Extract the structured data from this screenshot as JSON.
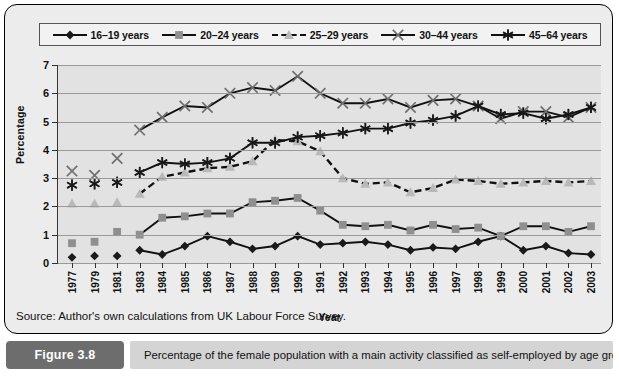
{
  "figure": {
    "badge": "Figure 3.8",
    "caption": "Percentage of the female population with a main activity classified as self-employed by age group",
    "source": "Source: Author's own calculations from UK Labour Force Survey."
  },
  "chart_data": {
    "type": "line",
    "title": "",
    "xlabel": "Year",
    "ylabel": "Percentage",
    "ylim": [
      0,
      7
    ],
    "yticks": [
      0,
      1,
      2,
      3,
      4,
      5,
      6,
      7
    ],
    "grid": true,
    "legend_position": "top",
    "categories": [
      "1977",
      "1979",
      "1981",
      "1983",
      "1984",
      "1985",
      "1986",
      "1987",
      "1988",
      "1989",
      "1990",
      "1991",
      "1992",
      "1993",
      "1994",
      "1995",
      "1996",
      "1997",
      "1998",
      "1999",
      "2000",
      "2001",
      "2002",
      "2003"
    ],
    "series": [
      {
        "name": "16–19 years",
        "marker": "diamond",
        "color": "#1a1a1a",
        "line": "solid",
        "values": [
          0.2,
          0.25,
          0.25,
          0.45,
          0.3,
          0.6,
          0.95,
          0.75,
          0.5,
          0.6,
          0.95,
          0.65,
          0.7,
          0.75,
          0.65,
          0.45,
          0.55,
          0.5,
          0.75,
          0.95,
          0.45,
          0.6,
          0.35,
          0.3
        ]
      },
      {
        "name": "20–24 years",
        "marker": "square",
        "color": "#8f8f8f",
        "line": "solid",
        "values": [
          0.7,
          0.75,
          1.1,
          1.0,
          1.6,
          1.65,
          1.75,
          1.75,
          2.15,
          2.2,
          2.3,
          1.85,
          1.35,
          1.3,
          1.35,
          1.15,
          1.35,
          1.2,
          1.25,
          0.95,
          1.3,
          1.3,
          1.1,
          1.3
        ]
      },
      {
        "name": "25–29 years",
        "marker": "triangle",
        "color": "#b9b9b9",
        "line": "dashed",
        "values": [
          2.1,
          2.1,
          2.15,
          2.45,
          3.05,
          3.2,
          3.35,
          3.4,
          3.6,
          4.35,
          4.3,
          3.95,
          3.0,
          2.8,
          2.85,
          2.5,
          2.65,
          2.95,
          2.9,
          2.8,
          2.85,
          2.9,
          2.85,
          2.9
        ]
      },
      {
        "name": "30–44 years",
        "marker": "x",
        "color": "#6e6e6e",
        "line": "solid",
        "values": [
          3.25,
          3.1,
          3.7,
          4.7,
          5.15,
          5.55,
          5.5,
          6.0,
          6.2,
          6.1,
          6.6,
          6.0,
          5.65,
          5.65,
          5.8,
          5.5,
          5.75,
          5.8,
          5.55,
          5.1,
          5.35,
          5.35,
          5.15,
          5.5
        ]
      },
      {
        "name": "45–64 years",
        "marker": "star",
        "color": "#1a1a1a",
        "line": "solid",
        "values": [
          2.75,
          2.8,
          2.85,
          3.2,
          3.55,
          3.5,
          3.55,
          3.7,
          4.25,
          4.25,
          4.45,
          4.5,
          4.6,
          4.75,
          4.75,
          4.95,
          5.05,
          5.2,
          5.55,
          5.25,
          5.3,
          5.1,
          5.25,
          5.5
        ]
      }
    ]
  }
}
